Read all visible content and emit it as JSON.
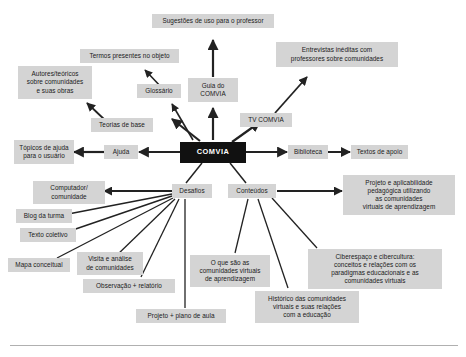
{
  "diagram": {
    "title": "COMVIA",
    "center": {
      "label": "COMVIA"
    },
    "nodes": [
      {
        "id": "sugestoes",
        "label": "Sugestões de uso para o professor"
      },
      {
        "id": "termos",
        "label": "Termos presentes no objeto"
      },
      {
        "id": "entrevistas",
        "label": "Entrevistas inéditas com\nprofessores sobre comunidades"
      },
      {
        "id": "autores",
        "label": "Autores/teóricos\nsobre comunidades\ne suas obras"
      },
      {
        "id": "glossario",
        "label": "Glossário"
      },
      {
        "id": "guia",
        "label": "Guia do\nCOMVIA"
      },
      {
        "id": "tvcomvia",
        "label": "TV COMVIA"
      },
      {
        "id": "teorias",
        "label": "Teorias de base"
      },
      {
        "id": "topicos",
        "label": "Tópicos de ajuda\npara o usuário"
      },
      {
        "id": "ajuda",
        "label": "Ajuda"
      },
      {
        "id": "biblioteca",
        "label": "Biblioteca"
      },
      {
        "id": "textos",
        "label": "Textos de apoio"
      },
      {
        "id": "computador",
        "label": "Computador/\ncomunidade"
      },
      {
        "id": "desafios",
        "label": "Desafios"
      },
      {
        "id": "conteudos",
        "label": "Conteúdos"
      },
      {
        "id": "projeto_apl",
        "label": "Projeto e aplicabilidade\npedagógica  utilizando\nas comunidades\nvirtuais de aprendizagem"
      },
      {
        "id": "blog",
        "label": "Blog da turma"
      },
      {
        "id": "textocol",
        "label": "Texto coletivo"
      },
      {
        "id": "mapa",
        "label": "Mapa conceitual"
      },
      {
        "id": "visita",
        "label": "Visita e análise\nde comunidades"
      },
      {
        "id": "ciberespaco",
        "label": "Ciberespaço e cibercultura:\nconceitos e relações com os\nparadigmas educacionais e as\ncomunidades virtuais"
      },
      {
        "id": "observacao",
        "label": "Observação + relatório"
      },
      {
        "id": "oquesao",
        "label": "O que são as\ncomunidades virtuais\nde aprendizagem"
      },
      {
        "id": "historico",
        "label": "Histórico das comunidades\nvirtuais e suas relações\ncom a educação"
      },
      {
        "id": "projetoplano",
        "label": "Projeto + plano de aula"
      }
    ],
    "colors": {
      "node_fill": "#d4d4d4",
      "center_fill": "#111111",
      "center_text": "#ffffff",
      "edge": "#222222",
      "text": "#1a1a1a",
      "background": "#ffffff",
      "rule": "#b0b0b0"
    }
  }
}
